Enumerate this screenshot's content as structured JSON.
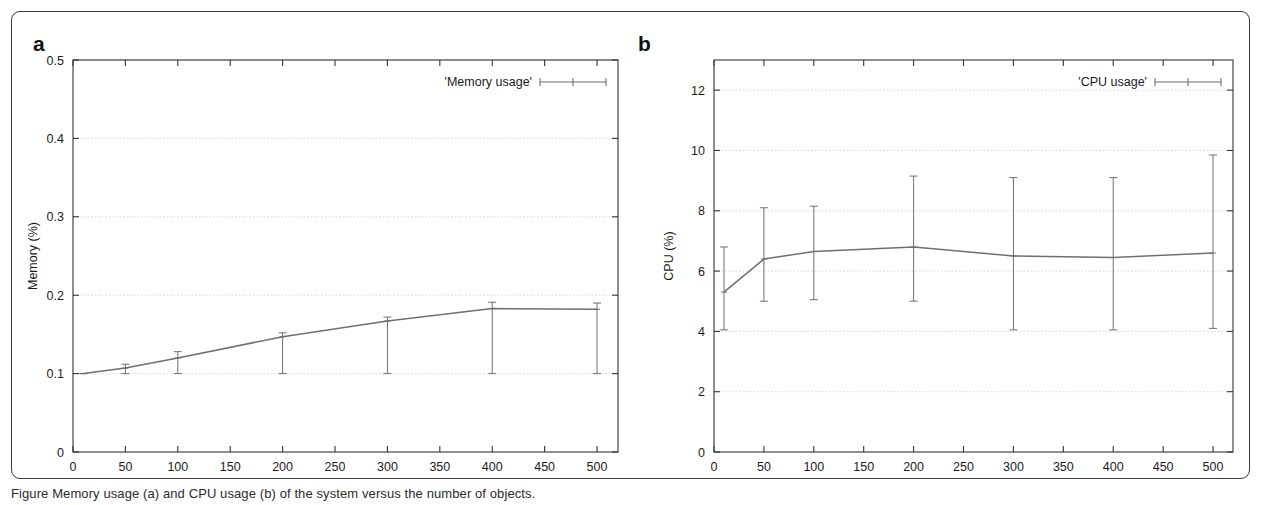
{
  "figure": {
    "background_color": "#ffffff",
    "frame_color": "#3a3a3a",
    "plot_line_color": "#6f6f6f",
    "grid_color": "#c8c8c8",
    "axis_color": "#333333",
    "caption": "Figure  Memory usage (a) and CPU usage (b) of the system versus the number of objects."
  },
  "panels": [
    {
      "letter": "a",
      "name": "memory-usage-panel",
      "legend": "'Memory usage'"
    },
    {
      "letter": "b",
      "name": "cpu-usage-panel",
      "legend": "'CPU usage'"
    }
  ],
  "chart_data": [
    {
      "type": "line",
      "panel": "a",
      "title": "",
      "legend": [
        "'Memory usage'"
      ],
      "legend_position": "top-right",
      "grid": true,
      "xlabel": "Number of objects",
      "ylabel": "Memory (%)",
      "xlim": [
        0,
        520
      ],
      "ylim": [
        0,
        0.5
      ],
      "xticks": [
        0,
        50,
        100,
        150,
        200,
        250,
        300,
        350,
        400,
        450,
        500
      ],
      "xtick_labels": [
        "0",
        "50",
        "100",
        "150",
        "200",
        "250",
        "300",
        "350",
        "400",
        "450",
        "500"
      ],
      "yticks": [
        0,
        0.1,
        0.2,
        0.3,
        0.4,
        0.5
      ],
      "ytick_labels": [
        "0",
        "0.1",
        "0.2",
        "0.3",
        "0.4",
        "0.5"
      ],
      "x": [
        10,
        50,
        100,
        200,
        300,
        400,
        500
      ],
      "values": [
        0.1,
        0.107,
        0.12,
        0.147,
        0.167,
        0.183,
        0.182
      ],
      "yerr_low": [
        0.1,
        0.1,
        0.1,
        0.1,
        0.1,
        0.1,
        0.1
      ],
      "yerr_high": [
        0.1,
        0.112,
        0.128,
        0.152,
        0.172,
        0.191,
        0.19
      ]
    },
    {
      "type": "line",
      "panel": "b",
      "title": "",
      "legend": [
        "'CPU usage'"
      ],
      "legend_position": "top-right",
      "grid": true,
      "xlabel": "Number of objects",
      "ylabel": "CPU (%)",
      "xlim": [
        0,
        520
      ],
      "ylim": [
        0,
        13
      ],
      "xticks": [
        0,
        50,
        100,
        150,
        200,
        250,
        300,
        350,
        400,
        450,
        500
      ],
      "xtick_labels": [
        "0",
        "50",
        "100",
        "150",
        "200",
        "250",
        "300",
        "350",
        "400",
        "450",
        "500"
      ],
      "yticks": [
        0,
        2,
        4,
        6,
        8,
        10,
        12
      ],
      "ytick_labels": [
        "0",
        "2",
        "4",
        "6",
        "8",
        "10",
        "12"
      ],
      "x": [
        10,
        50,
        100,
        200,
        300,
        400,
        500
      ],
      "values": [
        5.3,
        6.4,
        6.65,
        6.8,
        6.5,
        6.45,
        6.6
      ],
      "yerr_low": [
        4.05,
        5.0,
        5.05,
        5.0,
        4.05,
        4.05,
        4.1
      ],
      "yerr_high": [
        6.8,
        8.1,
        8.15,
        9.15,
        9.1,
        9.1,
        9.85
      ]
    }
  ]
}
